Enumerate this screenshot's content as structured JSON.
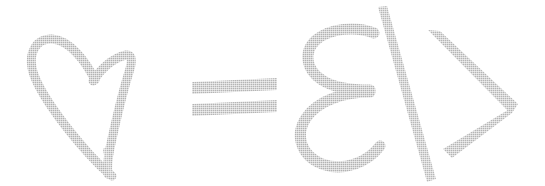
{
  "image": {
    "kind": "handwritten-glyph-equation",
    "width": 545,
    "height": 186,
    "background_color": "#ffffff",
    "ink_color": "#b3b3b3",
    "ink_color_light": "#c4c4c4",
    "transcription": "♡ = ε/>",
    "description": "Hand-drawn light gray sketch reading heart equals epsilon slash greater-than"
  },
  "glyphs": [
    {
      "id": "heart",
      "name": "heart-outline",
      "character": "♡",
      "label": "heart",
      "order": 1,
      "bbox": [
        30,
        36,
        130,
        176
      ]
    },
    {
      "id": "equals",
      "name": "equals-sign",
      "character": "=",
      "label": "equals",
      "order": 2,
      "bbox": [
        190,
        78,
        279,
        115
      ]
    },
    {
      "id": "epsilon",
      "name": "epsilon-letter",
      "character": "ε",
      "label": "epsilon",
      "order": 3,
      "bbox": [
        296,
        28,
        386,
        168
      ]
    },
    {
      "id": "slash",
      "name": "forward-slash",
      "character": "/",
      "label": "slash",
      "order": 4,
      "bbox": [
        378,
        6,
        436,
        182
      ]
    },
    {
      "id": "chevron",
      "name": "greater-than-sign",
      "character": ">",
      "label": "greater than",
      "order": 5,
      "bbox": [
        428,
        30,
        518,
        158
      ]
    }
  ]
}
